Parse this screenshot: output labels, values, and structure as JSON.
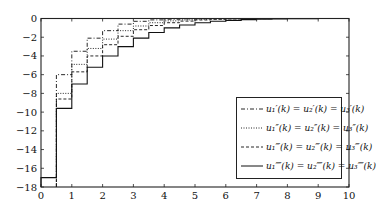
{
  "chart_data": {
    "type": "line",
    "subtype": "step",
    "title": "",
    "xlabel": "",
    "ylabel": "",
    "xlim": [
      0,
      10
    ],
    "ylim": [
      -18,
      0
    ],
    "xticks": [
      0,
      1,
      2,
      3,
      4,
      5,
      6,
      7,
      8,
      9,
      10
    ],
    "xtick_labels": [
      "0",
      "1",
      "2",
      "3",
      "4",
      "5",
      "6",
      "7",
      "8",
      "9",
      "10"
    ],
    "yticks": [
      0,
      -2,
      -4,
      -6,
      -8,
      -10,
      -12,
      -14,
      -16,
      -18
    ],
    "ytick_labels": [
      "0",
      "−2",
      "−4",
      "−6",
      "−8",
      "−10",
      "−12",
      "−14",
      "−16",
      "−18"
    ],
    "grid": false,
    "legend_position": "lower right",
    "x": [
      0,
      0.5,
      1,
      1.5,
      2,
      2.5,
      3,
      3.5,
      4,
      4.5,
      5,
      5.5,
      6,
      6.5,
      7,
      7.5,
      8,
      8.5,
      9,
      9.5,
      10
    ],
    "series": [
      {
        "name": "u₁ᵢ(k) = u₂ᵢ(k) = u₃ᵢ(k)",
        "style": "dashdot",
        "values": [
          null,
          -6.0,
          -3.5,
          -2.1,
          -1.3,
          -0.6,
          -0.3,
          -0.15,
          -0.08,
          -0.04,
          -0.02,
          -0.01,
          0,
          0,
          0,
          0,
          0,
          0,
          0,
          0,
          0
        ]
      },
      {
        "name": "u₁ᵢᵢ(k) = u₂ᵢᵢ(k) = u₃ᵢᵢ(k)",
        "style": "dotted",
        "values": [
          null,
          -8.0,
          -4.9,
          -3.2,
          -2.2,
          -1.3,
          -0.8,
          -0.45,
          -0.25,
          -0.15,
          -0.08,
          -0.04,
          -0.02,
          -0.01,
          0,
          0,
          0,
          0,
          0,
          0,
          0
        ]
      },
      {
        "name": "u₁ᵢᵢᵢ(k) = u₂ᵢᵢᵢ(k) = u₃ᵢᵢᵢ(k)",
        "style": "dashed",
        "values": [
          null,
          -8.6,
          -5.7,
          -4.0,
          -2.8,
          -1.9,
          -1.2,
          -0.75,
          -0.45,
          -0.28,
          -0.16,
          -0.09,
          -0.05,
          -0.03,
          -0.01,
          0,
          0,
          0,
          0,
          0,
          0
        ]
      },
      {
        "name": "u₁ᵢᵥ(k) = u₂ᵢᵥ(k) = u₃ᵢᵥ(k)",
        "style": "solid",
        "values": [
          -17.0,
          -9.6,
          -7.0,
          -5.2,
          -4.0,
          -3.0,
          -2.1,
          -1.5,
          -1.0,
          -0.7,
          -0.45,
          -0.3,
          -0.2,
          -0.12,
          -0.07,
          -0.04,
          -0.02,
          -0.01,
          0,
          0,
          0
        ]
      }
    ]
  },
  "legend": {
    "entries": [
      {
        "label": "u₁′(k) = u₂′(k) = u₃′(k)",
        "style": "dashdot"
      },
      {
        "label": "u₁″(k) = u₂″(k) = u₃″(k)",
        "style": "dotted"
      },
      {
        "label": "u₁‴(k) = u₂‴(k) = u₃‴(k)",
        "style": "dashed"
      },
      {
        "label": "u₁⁗(k) = u₂⁗(k) = u₃⁗(k)",
        "style": "solid"
      }
    ]
  },
  "colors": {
    "line": "#111111",
    "axis": "#222222",
    "background": "#ffffff"
  }
}
